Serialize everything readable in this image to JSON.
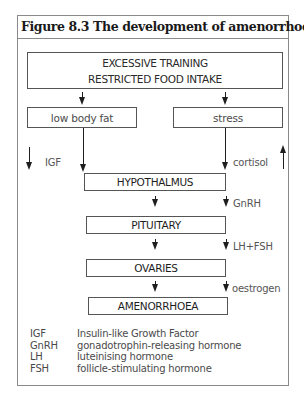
{
  "figure": {
    "title": "Figure 8.3 The development of amenorrhoea"
  },
  "diagram": {
    "top_box": {
      "line1": "EXCESSIVE TRAINING",
      "line2": "RESTRICTED FOOD INTAKE"
    },
    "left_box": "low body fat",
    "right_box": "stress",
    "side_labels": {
      "igf": "IGF",
      "cortisol": "cortisol",
      "gnrh": "GnRH",
      "lh_fsh": "LH+FSH",
      "oestrogen": "oestrogen"
    },
    "chain": [
      "HYPOTHALMUS",
      "PITUITARY",
      "OVARIES",
      "AMENORRHOEA"
    ],
    "indicators": {
      "igf_direction": "down",
      "cortisol_direction": "up"
    }
  },
  "legend": [
    {
      "abbr": "IGF",
      "meaning": "Insulin-like Growth Factor"
    },
    {
      "abbr": "GnRH",
      "meaning": "gonadotrophin-releasing hormone"
    },
    {
      "abbr": "LH",
      "meaning": "luteinising hormone"
    },
    {
      "abbr": "FSH",
      "meaning": "follicle-stimulating hormone"
    }
  ],
  "colors": {
    "line": "#1e1e1e",
    "frame": "#8a8a8a",
    "text": "#2a2a2a"
  }
}
